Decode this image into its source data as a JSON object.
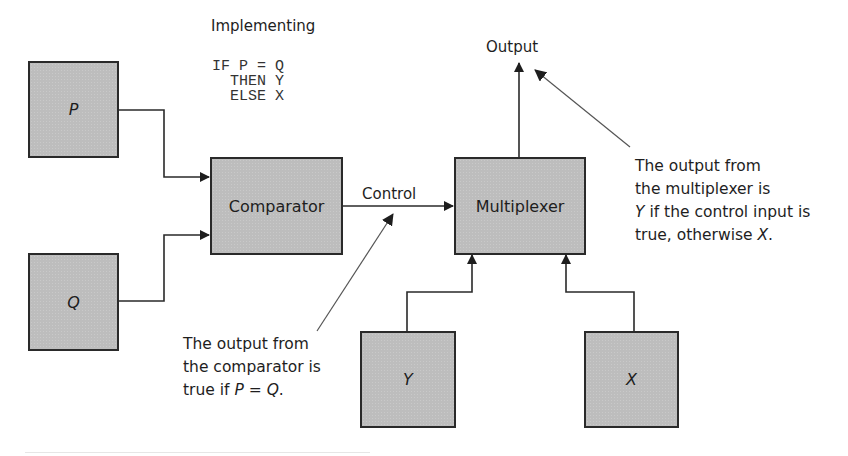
{
  "title": "Implementing",
  "code_lines": [
    "IF P = Q",
    "  THEN Y",
    "  ELSE X"
  ],
  "boxes": {
    "p": {
      "label": "P"
    },
    "q": {
      "label": "Q"
    },
    "comparator": {
      "label": "Comparator"
    },
    "multiplexer": {
      "label": "Multiplexer"
    },
    "y": {
      "label": "Y"
    },
    "x": {
      "label": "X"
    }
  },
  "signals": {
    "control": "Control",
    "output": "Output"
  },
  "notes": {
    "comparator": {
      "line1": "The output from",
      "line2": "the comparator is",
      "line3_prefix": "true if ",
      "line3_expr": "P = Q",
      "line3_suffix": "."
    },
    "multiplexer": {
      "line1": "The output from",
      "line2": "the multiplexer is",
      "line3_var": "Y",
      "line3_rest": " if the control input is",
      "line4_prefix": "true, otherwise ",
      "line4_var": "X",
      "line4_suffix": "."
    }
  },
  "colors": {
    "box_fill": "#bdbdbd",
    "stroke": "#2a2a2a",
    "annotation_line": "#555555"
  }
}
